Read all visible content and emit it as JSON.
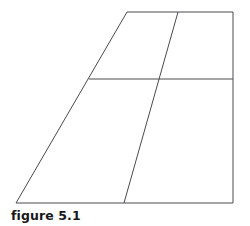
{
  "page": {
    "background_color": "#ffffff",
    "width": 250,
    "height": 226
  },
  "figure": {
    "caption": "figure 5.1",
    "caption_color": "#18181a",
    "stroke_color": "#4a4a4f",
    "stroke_width": 1,
    "fill": "none",
    "shape_name": "trapezoid-divided",
    "outline_points": "127,12 233,12 233,203 16,203",
    "outline_vertices": [
      {
        "name": "top-left",
        "x": 127,
        "y": 12
      },
      {
        "name": "top-right",
        "x": 233,
        "y": 12
      },
      {
        "name": "bottom-right",
        "x": 233,
        "y": 203
      },
      {
        "name": "bottom-left",
        "x": 16,
        "y": 203
      }
    ],
    "interior_lines": [
      {
        "name": "horizontal-divider",
        "x1": 89,
        "y1": 79,
        "x2": 233,
        "y2": 79
      },
      {
        "name": "slanted-divider",
        "x1": 178,
        "y1": 12,
        "x2": 124,
        "y2": 203
      }
    ],
    "intersections": [
      {
        "name": "slant-horizontal-intersection",
        "x": 162,
        "y": 79
      },
      {
        "name": "left-edge-horizontal-intersection",
        "x": 89,
        "y": 79
      }
    ]
  },
  "chart_data": {
    "type": "table",
    "title": "figure 5.1",
    "xlabel": "",
    "ylabel": "",
    "categories": [
      "upper-left",
      "upper-right",
      "lower-left",
      "lower-right"
    ],
    "values": [
      1,
      1,
      1,
      1
    ],
    "annotations": [
      "figure 5.1"
    ]
  }
}
